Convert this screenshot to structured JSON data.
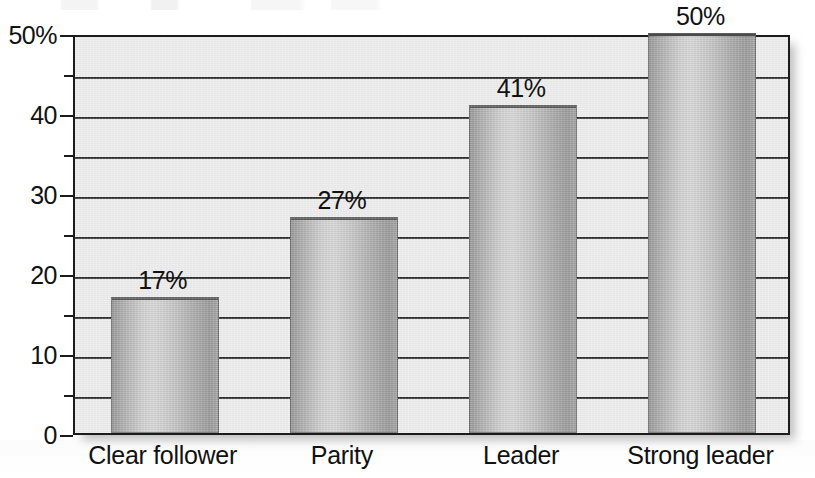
{
  "chart_data": {
    "type": "bar",
    "title": "",
    "subtitle": "",
    "xlabel": "",
    "ylabel": "",
    "categories": [
      "Clear follower",
      "Parity",
      "Leader",
      "Strong leader"
    ],
    "values": [
      17,
      27,
      41,
      50
    ],
    "value_labels": [
      "17%",
      "27%",
      "41%",
      "50%"
    ],
    "ylim": [
      0,
      50
    ],
    "y_major_ticks": [
      0,
      10,
      20,
      30,
      40,
      50
    ],
    "y_major_tick_labels": [
      "0",
      "10",
      "20",
      "30",
      "40",
      "50%"
    ],
    "y_minor_ticks": [
      5,
      15,
      25,
      35,
      45
    ],
    "gridlines": "horizontal",
    "grid": true,
    "legend": "none",
    "orientation": "vertical",
    "units": "percent",
    "bar_fill": "gray-gradient",
    "colors": {
      "plot_background": "#ebeaea",
      "axis": "#1b1b1b",
      "gridline": "#1d1d1d",
      "bar_dark": "#8d8d8d",
      "bar_light": "#cfcfcf",
      "text": "#111111",
      "page_background": "#ffffff"
    }
  }
}
